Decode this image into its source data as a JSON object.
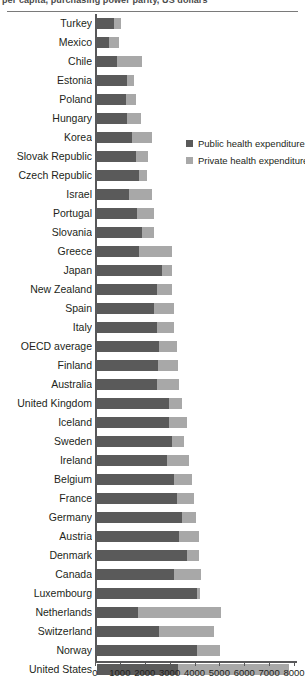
{
  "title": "per capita, purchasing power parity, US dollars",
  "legend": {
    "position": "top-right-inset",
    "items": [
      {
        "label": "Public health expenditure",
        "color": "#5a5a5a",
        "key": "public"
      },
      {
        "label": "Private health expenditure",
        "color": "#a8a8a8",
        "key": "private"
      }
    ]
  },
  "axis": {
    "x": {
      "ticks": [
        0,
        1000,
        2000,
        3000,
        4000,
        5000,
        6000,
        7000,
        8000
      ],
      "tick_labels": [
        "0",
        "1000",
        "2000",
        "3000",
        "4000",
        "5000",
        "6000",
        "7000",
        "8000"
      ],
      "min": 0,
      "max": 8000,
      "label": ""
    },
    "y": {
      "label": "",
      "grid": false
    }
  },
  "chart_data": {
    "type": "bar",
    "orientation": "horizontal",
    "stacked": true,
    "title": "per capita, purchasing power parity, US dollars",
    "xlabel": "",
    "ylabel": "",
    "xlim": [
      0,
      8000
    ],
    "grid": false,
    "legend_position": "top-right-inset",
    "categories": [
      "Turkey",
      "Mexico",
      "Chile",
      "Estonia",
      "Poland",
      "Hungary",
      "Korea",
      "Slovak Republic",
      "Czech Republic",
      "Israel",
      "Portugal",
      "Slovania",
      "Greece",
      "Japan",
      "New Zealand",
      "Spain",
      "Italy",
      "OECD average",
      "Finland",
      "Australia",
      "United Kingdom",
      "Iceland",
      "Sweden",
      "Ireland",
      "Belgium",
      "France",
      "Germany",
      "Austria",
      "Denmark",
      "Canada",
      "Luxembourg",
      "Netherlands",
      "Switzerland",
      "Norway",
      "United States"
    ],
    "series": [
      {
        "name": "Public health expenditure",
        "color": "#5a5a5a",
        "values": [
          700,
          500,
          800,
          1200,
          1150,
          1200,
          1400,
          1550,
          1700,
          1300,
          1600,
          1800,
          1700,
          2600,
          2400,
          2300,
          2400,
          2500,
          2450,
          2400,
          2900,
          2900,
          3000,
          2800,
          3100,
          3200,
          3400,
          3300,
          3600,
          3100,
          4000,
          1650,
          2500,
          4000,
          3250
        ]
      },
      {
        "name": "Private health expenditure",
        "color": "#a8a8a8",
        "values": [
          250,
          400,
          1000,
          300,
          400,
          550,
          800,
          500,
          300,
          900,
          700,
          500,
          1300,
          400,
          600,
          800,
          700,
          700,
          800,
          900,
          500,
          700,
          500,
          900,
          700,
          700,
          600,
          800,
          500,
          1100,
          150,
          3350,
          2200,
          950,
          4450
        ]
      }
    ]
  }
}
